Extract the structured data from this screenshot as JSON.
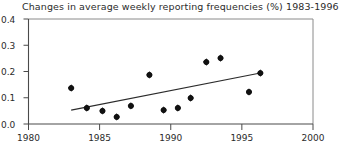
{
  "chart_data": {
    "type": "scatter",
    "title": "Changes in average weekly reporting frequencies (%) 1983-1996",
    "xlabel": "",
    "ylabel": "",
    "xlim": [
      1980,
      2000
    ],
    "ylim": [
      0.0,
      0.4
    ],
    "xticks": [
      1980,
      1985,
      1990,
      1995,
      2000
    ],
    "xtick_labels": [
      "1980",
      "1985",
      "1990",
      "1995",
      "2000"
    ],
    "yticks": [
      0.0,
      0.1,
      0.2,
      0.3,
      0.4
    ],
    "ytick_labels": [
      "0.0",
      "0.1",
      "0.2",
      "0.3",
      "0.4"
    ],
    "grid": false,
    "legend": null,
    "marker": "filled-diamond",
    "marker_color": "#111111",
    "series": [
      {
        "name": "Change in average weekly reporting frequency",
        "points": [
          {
            "x": 1983.0,
            "y": 0.137
          },
          {
            "x": 1984.1,
            "y": 0.061
          },
          {
            "x": 1985.2,
            "y": 0.05
          },
          {
            "x": 1986.2,
            "y": 0.027
          },
          {
            "x": 1987.2,
            "y": 0.069
          },
          {
            "x": 1988.5,
            "y": 0.187
          },
          {
            "x": 1989.5,
            "y": 0.053
          },
          {
            "x": 1990.5,
            "y": 0.061
          },
          {
            "x": 1991.4,
            "y": 0.099
          },
          {
            "x": 1992.5,
            "y": 0.236
          },
          {
            "x": 1993.5,
            "y": 0.251
          },
          {
            "x": 1995.5,
            "y": 0.122
          },
          {
            "x": 1996.3,
            "y": 0.194
          }
        ]
      }
    ],
    "trend_line": {
      "name": "linear trend",
      "color": "#2b2b2b",
      "start": {
        "x": 1983.0,
        "y": 0.053
      },
      "end": {
        "x": 1996.3,
        "y": 0.194
      }
    }
  }
}
